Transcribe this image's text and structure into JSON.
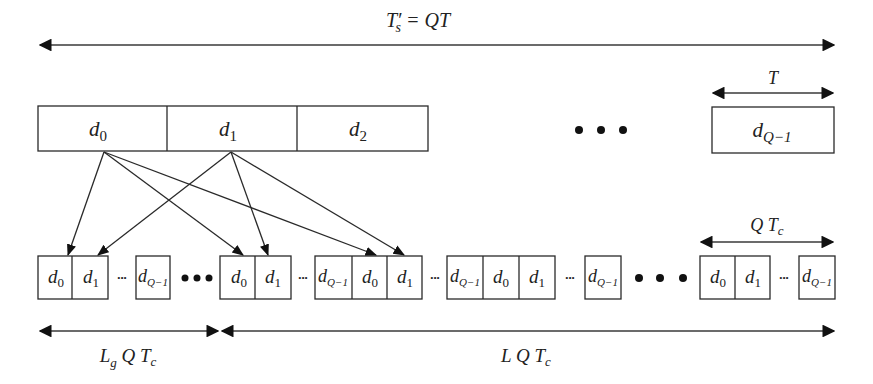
{
  "title_label": {
    "main": "T",
    "prime": "′",
    "sub": "s",
    "rest": " = QT"
  },
  "top_row": {
    "boxes": [
      {
        "base": "d",
        "sub": "0"
      },
      {
        "base": "d",
        "sub": "1"
      },
      {
        "base": "d",
        "sub": "2"
      }
    ],
    "ellipsis": "•••",
    "last_box": {
      "base": "d",
      "sub": "Q−1"
    },
    "period_label": "T"
  },
  "bottom_row": {
    "groups": [
      {
        "cells": [
          {
            "base": "d",
            "sub": "0"
          },
          {
            "base": "d",
            "sub": "1"
          }
        ],
        "inner_ellipsis": "•••",
        "tail": {
          "base": "d",
          "sub": "Q−1"
        }
      },
      {
        "cells": [
          {
            "base": "d",
            "sub": "0"
          },
          {
            "base": "d",
            "sub": "1"
          }
        ],
        "inner_ellipsis": "•••",
        "tail": {
          "base": "d",
          "sub": "Q−1"
        }
      },
      {
        "cells": [
          {
            "base": "d",
            "sub": "Q−1"
          },
          {
            "base": "d",
            "sub": "0"
          },
          {
            "base": "d",
            "sub": "1"
          }
        ],
        "inner_ellipsis": "•••"
      },
      {
        "cells": [
          {
            "base": "d",
            "sub": "Q−1"
          },
          {
            "base": "d",
            "sub": "0"
          },
          {
            "base": "d",
            "sub": "1"
          }
        ],
        "inner_ellipsis": "•••",
        "tail": {
          "base": "d",
          "sub": "Q−1"
        }
      },
      {
        "cells": [
          {
            "base": "d",
            "sub": "0"
          },
          {
            "base": "d",
            "sub": "1"
          }
        ],
        "inner_ellipsis": "•••",
        "tail": {
          "base": "d",
          "sub": "Q−1"
        }
      }
    ],
    "chip_period_label": {
      "pre": "Q T",
      "sub": "c"
    }
  },
  "bottom_dimensions": {
    "guard_label": {
      "L": "L",
      "g": "g",
      "rest": " Q T",
      "c": "c"
    },
    "data_label": {
      "pre": "L Q T",
      "c": "c"
    }
  },
  "arrows": [
    {
      "from": "d0",
      "to": "group1-d0"
    },
    {
      "from": "d0",
      "to": "group2-d0"
    },
    {
      "from": "d0",
      "to": "group3-d0"
    },
    {
      "from": "d1",
      "to": "group1-d1"
    },
    {
      "from": "d1",
      "to": "group2-d1"
    },
    {
      "from": "d1",
      "to": "group3-d1"
    }
  ]
}
